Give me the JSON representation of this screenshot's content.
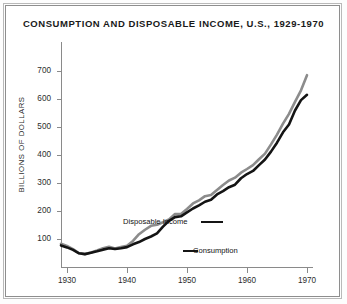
{
  "figure": {
    "title": "CONSUMPTION AND DISPOSABLE INCOME, U.S., 1929-1970",
    "ylabel": "BILLIONS OF DOLLARS",
    "annotation_income": "Disposable Income",
    "annotation_consumption": "Consumption",
    "colors": {
      "consumption": "#141414",
      "disposable_income": "#8c8c8c",
      "axis": "#8a8a8a",
      "text": "#1a1a1a",
      "frame_outer": "#b9b9b9",
      "frame_inner": "#8e8e8e"
    }
  },
  "chart_data": {
    "type": "line",
    "title": "CONSUMPTION AND DISPOSABLE INCOME, U.S., 1929-1970",
    "xlabel": "",
    "ylabel": "BILLIONS OF DOLLARS",
    "xlim": [
      1929,
      1971
    ],
    "ylim": [
      0,
      750
    ],
    "xticks": [
      1930,
      1940,
      1950,
      1960,
      1970
    ],
    "yticks": [
      100,
      200,
      300,
      400,
      500,
      600,
      700
    ],
    "grid": false,
    "legend_position": "inline-annotations",
    "x": [
      1929,
      1930,
      1931,
      1932,
      1933,
      1934,
      1935,
      1936,
      1937,
      1938,
      1939,
      1940,
      1941,
      1942,
      1943,
      1944,
      1945,
      1946,
      1947,
      1948,
      1949,
      1950,
      1951,
      1952,
      1953,
      1954,
      1955,
      1956,
      1957,
      1958,
      1959,
      1960,
      1961,
      1962,
      1963,
      1964,
      1965,
      1966,
      1967,
      1968,
      1969,
      1970
    ],
    "series": [
      {
        "name": "Disposable Income",
        "color": "#8c8c8c",
        "values": [
          83,
          75,
          64,
          49,
          46,
          52,
          59,
          67,
          72,
          66,
          71,
          76,
          93,
          117,
          133,
          147,
          151,
          160,
          170,
          189,
          189,
          207,
          227,
          238,
          253,
          257,
          275,
          293,
          309,
          319,
          337,
          350,
          364,
          385,
          405,
          438,
          473,
          512,
          547,
          590,
          631,
          685
        ]
      },
      {
        "name": "Consumption",
        "color": "#141414",
        "values": [
          77,
          70,
          61,
          49,
          46,
          51,
          56,
          62,
          67,
          64,
          67,
          71,
          81,
          89,
          100,
          109,
          120,
          144,
          165,
          178,
          181,
          195,
          209,
          220,
          233,
          240,
          259,
          271,
          285,
          294,
          317,
          332,
          343,
          364,
          384,
          412,
          444,
          481,
          509,
          559,
          596,
          615
        ]
      }
    ],
    "annotations": [
      {
        "text": "Disposable Income",
        "series": "Disposable Income"
      },
      {
        "text": "Consumption",
        "series": "Consumption"
      }
    ]
  }
}
